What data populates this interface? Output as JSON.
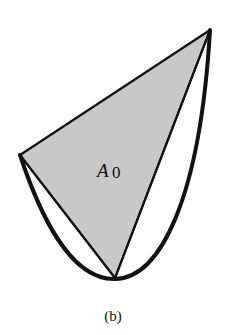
{
  "figure": {
    "region_label": "A",
    "region_subscript": "0",
    "caption": "(b)",
    "colors": {
      "fill": "#c8c8c8",
      "stroke": "#111111",
      "background": "#ffffff"
    },
    "vertices": {
      "top_right": [
        210,
        30
      ],
      "left": [
        20,
        155
      ],
      "bottom": [
        115,
        278
      ]
    }
  }
}
